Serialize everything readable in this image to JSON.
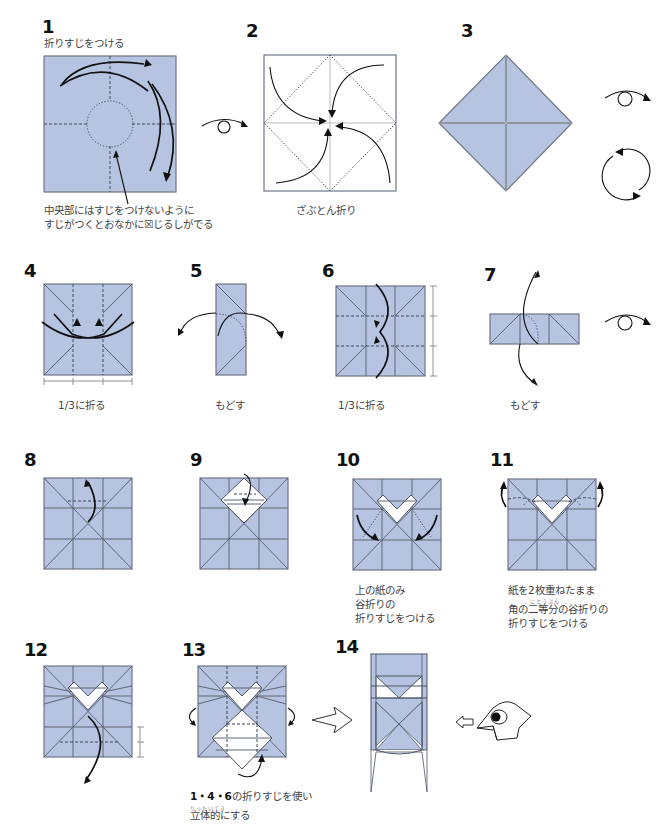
{
  "colors": {
    "paper": "#b6c4e2",
    "line": "#5e6676",
    "arrow": "#111111",
    "background": "#ffffff"
  },
  "steps": [
    {
      "num": "1",
      "caption_top": "折りすじをつける",
      "caption": [
        "中央部にはすじをつけないように",
        "すじがつくとおなかに☒じるしがでる"
      ]
    },
    {
      "num": "2",
      "caption": [
        "ざぶとん折り"
      ]
    },
    {
      "num": "3",
      "caption": []
    },
    {
      "num": "4",
      "caption": [
        "1/3に折る"
      ]
    },
    {
      "num": "5",
      "caption": [
        "もどす"
      ]
    },
    {
      "num": "6",
      "caption": [
        "1/3に折る"
      ]
    },
    {
      "num": "7",
      "caption": [
        "もどす"
      ]
    },
    {
      "num": "8",
      "caption": []
    },
    {
      "num": "9",
      "caption": []
    },
    {
      "num": "10",
      "caption": [
        "上の紙のみ",
        "谷折りの",
        "折りすじをつける"
      ]
    },
    {
      "num": "11",
      "caption": [
        "紙を2枚重ねたまま",
        "角の二等分の谷折りの",
        "折りすじをつける"
      ],
      "ruby": "にとうぶん"
    },
    {
      "num": "12",
      "caption": []
    },
    {
      "num": "13",
      "caption_bold": "1・4・6",
      "caption": [
        "の折りすじを使い",
        "立体的にする"
      ],
      "ruby": "りったいてき"
    },
    {
      "num": "14",
      "caption": []
    }
  ],
  "symbols": [
    "turn-over-icon",
    "turn-over-icon",
    "turn-over-icon",
    "rotate-icon",
    "turn-over-icon",
    "next-arrow-icon",
    "view-direction-arrow-icon",
    "bird-head-icon"
  ]
}
